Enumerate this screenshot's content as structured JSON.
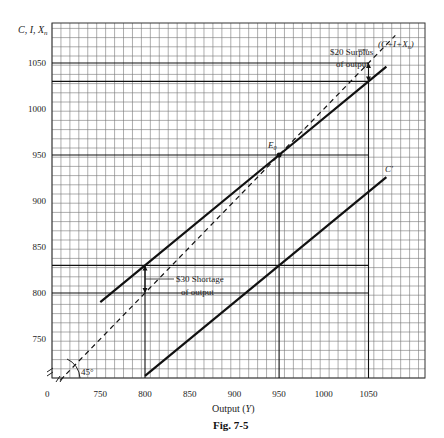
{
  "figure": {
    "caption": "Fig. 7-5",
    "x_axis_title": "Output (Y)",
    "y_axis_title": "C, I, X_n",
    "origin_label": "0"
  },
  "annotations": {
    "surplus_line1": "$20 Surplus",
    "surplus_line2": "of output",
    "shortage_line1": "$30 Shortage",
    "shortage_line2": "of output",
    "equilibrium_label": "E0",
    "aggregate_label": "(C+I+Xn)",
    "consumption_label": "C'",
    "angle_label": "45°"
  },
  "chart_data": {
    "type": "line",
    "title": "Fig. 7-5",
    "xlabel": "Output (Y)",
    "ylabel": "C, I, Xn",
    "x_ticks": [
      750,
      800,
      850,
      900,
      950,
      1000,
      1050
    ],
    "y_ticks": [
      750,
      800,
      850,
      900,
      950,
      1000,
      1050
    ],
    "xlim": [
      700,
      1100
    ],
    "ylim": [
      700,
      1085
    ],
    "grid": true,
    "axis_break": true,
    "series": [
      {
        "name": "C+I+Xn",
        "style": "solid",
        "x": [
          750,
          800,
          950,
          1050,
          1070
        ],
        "y": [
          790,
          830,
          950,
          1030,
          1046
        ]
      },
      {
        "name": "C'",
        "style": "solid",
        "x": [
          800,
          1070
        ],
        "y": [
          710,
          926
        ]
      },
      {
        "name": "45° line",
        "style": "dashed",
        "x": [
          705,
          1080
        ],
        "y": [
          705,
          1080
        ]
      }
    ],
    "points": [
      {
        "label": "E0",
        "x": 950,
        "y": 950
      }
    ],
    "reference_lines": [
      {
        "type": "horizontal",
        "y": 1050
      },
      {
        "type": "horizontal",
        "y": 1030
      },
      {
        "type": "horizontal",
        "y": 950
      },
      {
        "type": "horizontal",
        "y": 830
      },
      {
        "type": "horizontal",
        "y": 800
      },
      {
        "type": "vertical",
        "x": 800
      },
      {
        "type": "vertical",
        "x": 950
      },
      {
        "type": "vertical",
        "x": 1050
      }
    ],
    "annotations": [
      {
        "text": "$20 Surplus of output",
        "at_x": 1050,
        "from_y": 1030,
        "to_y": 1050
      },
      {
        "text": "$30 Shortage of output",
        "at_x": 800,
        "from_y": 800,
        "to_y": 830
      }
    ]
  }
}
